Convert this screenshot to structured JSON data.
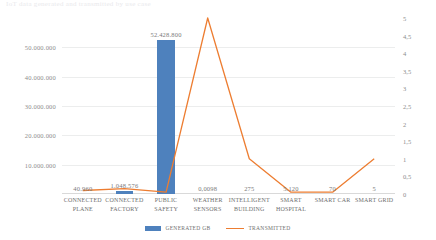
{
  "title_fragment": "IoT data generated and transmitted by use case",
  "legend": {
    "position": "bottom",
    "items": [
      {
        "label": "GENERATED GB",
        "type": "bar",
        "color": "#4E81BD",
        "icon": "legend-bar-swatch"
      },
      {
        "label": "TRANSMITTED",
        "type": "line",
        "color": "#ED7D31",
        "icon": "legend-line-swatch"
      }
    ]
  },
  "axes": {
    "left_ticks": [
      "50.000.000",
      "40.000.000",
      "30.000.000",
      "20.000.000",
      "10.000.000"
    ],
    "right_ticks": [
      "5",
      "4,5",
      "4",
      "3,5",
      "3",
      "2,5",
      "2",
      "1,5",
      "1",
      "0,5",
      "0"
    ]
  },
  "chart_data": {
    "type": "bar",
    "title": "IoT data generated and transmitted by use case",
    "xlabel": "",
    "ylabel": "",
    "grid": true,
    "legend_position": "bottom",
    "categories": [
      "CONNECTED PLANE",
      "CONNECTED FACTORY",
      "PUBLIC SAFETY",
      "WEATHER SENSORS",
      "INTELLIGENT BUILDING",
      "SMART HOSPITAL",
      "SMART CAR",
      "SMART GRID"
    ],
    "category_lines": [
      [
        "CONNECTED",
        "PLANE"
      ],
      [
        "CONNECTED",
        "FACTORY"
      ],
      [
        "PUBLIC",
        "SAFETY"
      ],
      [
        "WEATHER",
        "SENSORS"
      ],
      [
        "INTELLIGENT",
        "BUILDING"
      ],
      [
        "SMART",
        "HOSPITAL"
      ],
      [
        "SMART CAR"
      ],
      [
        "SMART GRID"
      ]
    ],
    "series": [
      {
        "name": "GENERATED GB",
        "type": "bar",
        "axis": "left",
        "color": "#4E81BD",
        "values": [
          40960,
          1048576,
          52428800,
          0.0098,
          275,
          5120,
          70,
          5
        ],
        "labels": [
          "40.960",
          "1.048.576",
          "52.428.800",
          "0,0098",
          "275",
          "5.120",
          "70",
          "5"
        ]
      },
      {
        "name": "TRANSMITTED",
        "type": "line",
        "axis": "right",
        "color": "#ED7D31",
        "values": [
          0.1,
          0.15,
          0.05,
          5,
          1,
          0.05,
          0.05,
          1
        ]
      }
    ],
    "left_axis": {
      "min": 0,
      "max": 60000000,
      "ticks": [
        10000000,
        20000000,
        30000000,
        40000000,
        50000000
      ]
    },
    "right_axis": {
      "min": 0,
      "max": 5,
      "ticks": [
        0,
        0.5,
        1,
        1.5,
        2,
        2.5,
        3,
        3.5,
        4,
        4.5,
        5
      ]
    }
  }
}
